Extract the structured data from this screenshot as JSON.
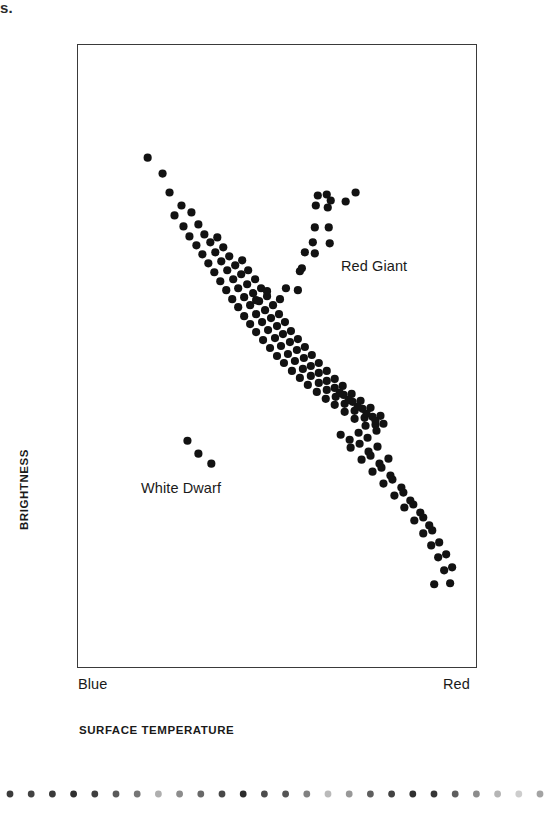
{
  "page": {
    "cut_header_fragment": "rs.",
    "background_color": "#ffffff",
    "ink_color": "#121212"
  },
  "figure": {
    "frame": {
      "x": 77,
      "y": 44,
      "width": 400,
      "height": 624,
      "border_color": "#3a3a3a"
    },
    "x_axis": {
      "title": "SURFACE TEMPERATURE",
      "left_label": "Blue",
      "right_label": "Red"
    },
    "y_axis": {
      "title": "BRIGHTNESS"
    },
    "annotations": [
      {
        "name": "red-giant",
        "text": "Red Giant"
      },
      {
        "name": "white-dwarf",
        "text": "White Dwarf"
      }
    ]
  },
  "decoration": {
    "dot_rule": {
      "count": 26,
      "start_x": 10,
      "spacing": 21.2,
      "radius": 3.4,
      "opacities": [
        0.85,
        0.82,
        0.86,
        0.9,
        0.84,
        0.72,
        0.6,
        0.35,
        0.5,
        0.66,
        0.8,
        0.92,
        0.78,
        0.74,
        0.55,
        0.3,
        0.45,
        0.7,
        0.82,
        0.9,
        0.88,
        0.7,
        0.5,
        0.32,
        0.22,
        0.4
      ]
    }
  },
  "chart_data": {
    "type": "scatter",
    "title": "",
    "xlabel": "SURFACE TEMPERATURE",
    "ylabel": "BRIGHTNESS",
    "xlim": [
      0,
      400
    ],
    "ylim": [
      0,
      624
    ],
    "x_tick_labels": [
      "Blue",
      "Red"
    ],
    "y_tick_labels": [],
    "grid": false,
    "legend": false,
    "note": "Hertzsprung-Russell diagram. Coordinates are pixel offsets inside the 400x624 plot frame; x increases toward 'Red' (cooler), y increases downward (dimmer).",
    "marker": {
      "shape": "circle",
      "radius": 4.1,
      "color": "#121212"
    },
    "series": [
      {
        "name": "Main Sequence",
        "points": [
          [
            70,
            113
          ],
          [
            85,
            129
          ],
          [
            92,
            148
          ],
          [
            104,
            161
          ],
          [
            97,
            171
          ],
          [
            114,
            168
          ],
          [
            106,
            182
          ],
          [
            121,
            180
          ],
          [
            112,
            192
          ],
          [
            127,
            190
          ],
          [
            119,
            201
          ],
          [
            133,
            198
          ],
          [
            140,
            193
          ],
          [
            125,
            210
          ],
          [
            138,
            208
          ],
          [
            146,
            203
          ],
          [
            131,
            219
          ],
          [
            144,
            217
          ],
          [
            152,
            212
          ],
          [
            137,
            228
          ],
          [
            150,
            226
          ],
          [
            158,
            221
          ],
          [
            165,
            216
          ],
          [
            143,
            237
          ],
          [
            156,
            235
          ],
          [
            164,
            230
          ],
          [
            171,
            226
          ],
          [
            149,
            246
          ],
          [
            161,
            244
          ],
          [
            170,
            240
          ],
          [
            178,
            235
          ],
          [
            155,
            255
          ],
          [
            167,
            253
          ],
          [
            176,
            249
          ],
          [
            184,
            244
          ],
          [
            161,
            263
          ],
          [
            173,
            261
          ],
          [
            182,
            257
          ],
          [
            190,
            252
          ],
          [
            167,
            272
          ],
          [
            179,
            270
          ],
          [
            188,
            266
          ],
          [
            196,
            261
          ],
          [
            173,
            280
          ],
          [
            185,
            278
          ],
          [
            194,
            274
          ],
          [
            202,
            270
          ],
          [
            179,
            288
          ],
          [
            191,
            286
          ],
          [
            200,
            282
          ],
          [
            208,
            278
          ],
          [
            186,
            296
          ],
          [
            198,
            294
          ],
          [
            206,
            290
          ],
          [
            214,
            287
          ],
          [
            193,
            304
          ],
          [
            204,
            302
          ],
          [
            213,
            298
          ],
          [
            221,
            295
          ],
          [
            200,
            312
          ],
          [
            211,
            310
          ],
          [
            220,
            306
          ],
          [
            228,
            303
          ],
          [
            207,
            319
          ],
          [
            218,
            317
          ],
          [
            227,
            314
          ],
          [
            235,
            311
          ],
          [
            215,
            327
          ],
          [
            226,
            325
          ],
          [
            234,
            322
          ],
          [
            242,
            319
          ],
          [
            223,
            334
          ],
          [
            234,
            332
          ],
          [
            242,
            329
          ],
          [
            250,
            327
          ],
          [
            231,
            341
          ],
          [
            242,
            339
          ],
          [
            250,
            337
          ],
          [
            258,
            335
          ],
          [
            240,
            348
          ],
          [
            250,
            346
          ],
          [
            258,
            344
          ],
          [
            266,
            342
          ],
          [
            249,
            355
          ],
          [
            259,
            353
          ],
          [
            267,
            351
          ],
          [
            275,
            350
          ],
          [
            258,
            361
          ],
          [
            268,
            360
          ],
          [
            276,
            358
          ],
          [
            284,
            357
          ],
          [
            268,
            368
          ],
          [
            278,
            367
          ],
          [
            286,
            365
          ],
          [
            294,
            364
          ],
          [
            278,
            375
          ],
          [
            288,
            374
          ],
          [
            296,
            373
          ],
          [
            304,
            372
          ],
          [
            289,
            382
          ],
          [
            299,
            381
          ],
          [
            307,
            380
          ],
          [
            263,
            349
          ],
          [
            272,
            356
          ],
          [
            281,
            363
          ],
          [
            290,
            370
          ],
          [
            299,
            377
          ],
          [
            264,
            391
          ],
          [
            273,
            396
          ],
          [
            282,
            389
          ],
          [
            291,
            394
          ],
          [
            300,
            387
          ],
          [
            274,
            404
          ],
          [
            283,
            400
          ],
          [
            292,
            408
          ],
          [
            301,
            403
          ],
          [
            285,
            416
          ],
          [
            294,
            412
          ],
          [
            303,
            420
          ],
          [
            312,
            415
          ],
          [
            296,
            428
          ],
          [
            305,
            424
          ],
          [
            314,
            432
          ],
          [
            307,
            440
          ],
          [
            316,
            436
          ],
          [
            325,
            444
          ],
          [
            318,
            452
          ],
          [
            327,
            449
          ],
          [
            334,
            457
          ],
          [
            328,
            464
          ],
          [
            337,
            461
          ],
          [
            344,
            469
          ],
          [
            338,
            477
          ],
          [
            347,
            474
          ],
          [
            353,
            482
          ],
          [
            347,
            490
          ],
          [
            356,
            487
          ],
          [
            355,
            502
          ],
          [
            363,
            499
          ],
          [
            362,
            514
          ],
          [
            370,
            511
          ],
          [
            368,
            527
          ],
          [
            376,
            524
          ],
          [
            374,
            540
          ],
          [
            358,
            541
          ]
        ]
      },
      {
        "name": "Red Giant Branch",
        "points": [
          [
            241,
            151
          ],
          [
            250,
            150
          ],
          [
            254,
            156
          ],
          [
            239,
            161
          ],
          [
            251,
            163
          ],
          [
            269,
            157
          ],
          [
            279,
            148
          ],
          [
            238,
            183
          ],
          [
            252,
            183
          ],
          [
            236,
            198
          ],
          [
            253,
            199
          ],
          [
            228,
            208
          ],
          [
            238,
            209
          ],
          [
            225,
            224
          ],
          [
            223,
            227
          ],
          [
            209,
            244
          ],
          [
            221,
            246
          ],
          [
            203,
            255
          ],
          [
            190,
            247
          ],
          [
            179,
            256
          ]
        ]
      },
      {
        "name": "White Dwarf",
        "points": [
          [
            110,
            397
          ],
          [
            121,
            410
          ],
          [
            134,
            420
          ]
        ]
      }
    ]
  }
}
